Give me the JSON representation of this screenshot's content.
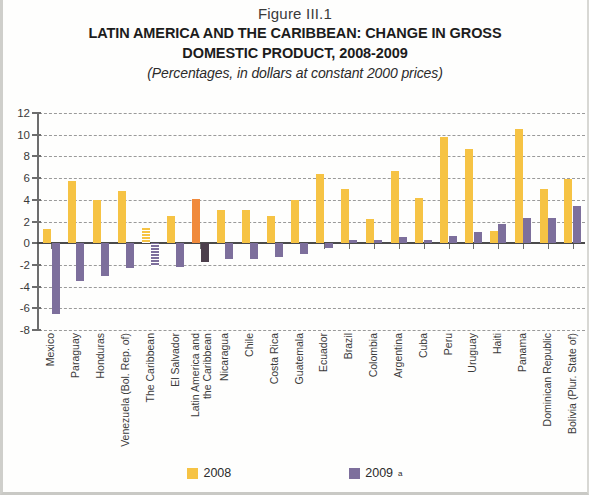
{
  "figure_number": "Figure III.1",
  "title_line1": "LATIN AMERICA AND THE CARIBBEAN: CHANGE IN GROSS",
  "title_line2": "DOMESTIC PRODUCT, 2008-2009",
  "subtitle": "(Percentages, in dollars at constant 2000 prices)",
  "legend": {
    "items": [
      {
        "label": "2008",
        "color": "#f6c344",
        "superscript": ""
      },
      {
        "label": "2009",
        "color": "#7d6f9c",
        "superscript": "a"
      }
    ]
  },
  "chart_data": {
    "type": "bar",
    "title": "LATIN AMERICA AND THE CARIBBEAN: CHANGE IN GROSS DOMESTIC PRODUCT, 2008-2009",
    "subtitle": "(Percentages, in dollars at constant 2000 prices)",
    "xlabel": "",
    "ylabel": "",
    "ylim": [
      -8,
      12
    ],
    "yticks": [
      12,
      10,
      8,
      6,
      4,
      2,
      0,
      -2,
      -4,
      -6,
      -8
    ],
    "ytick_labels": [
      "12",
      "10",
      "8",
      "6",
      "4",
      "2",
      "0",
      "-2",
      "-4",
      "-6",
      "-8"
    ],
    "grid": true,
    "legend_position": "bottom",
    "categories": [
      "Mexico",
      "Paraguay",
      "Honduras",
      "Venezuela (Bol. Rep. of)",
      "The Caribbean",
      "El Salvador",
      "Latin America and the Caribbean",
      "Nicaragua",
      "Chile",
      "Costa Rica",
      "Guatemala",
      "Ecuador",
      "Brazil",
      "Colombia",
      "Argentina",
      "Cuba",
      "Peru",
      "Uruguay",
      "Haiti",
      "Panama",
      "Dominican Republic",
      "Bolivia (Plur. State of)"
    ],
    "category_styles": [
      "normal",
      "normal",
      "normal",
      "normal",
      "hatch",
      "normal",
      "alt",
      "normal",
      "normal",
      "normal",
      "normal",
      "normal",
      "normal",
      "normal",
      "normal",
      "normal",
      "normal",
      "normal",
      "normal",
      "normal",
      "normal",
      "normal"
    ],
    "series": [
      {
        "name": "2008",
        "color": "#f6c344",
        "values": [
          1.3,
          5.7,
          4.0,
          4.8,
          1.4,
          2.5,
          4.1,
          3.1,
          3.1,
          2.5,
          4.0,
          6.4,
          5.0,
          2.2,
          6.7,
          4.2,
          9.8,
          8.7,
          1.1,
          10.5,
          5.0,
          5.9
        ]
      },
      {
        "name": "2009",
        "color": "#7d6f9c",
        "values": [
          -6.5,
          -3.5,
          -3.0,
          -2.3,
          -2.1,
          -2.2,
          -1.7,
          -1.5,
          -1.5,
          -1.3,
          -1.0,
          -0.4,
          0.3,
          0.3,
          0.6,
          0.3,
          0.7,
          1.0,
          1.8,
          2.3,
          2.3,
          3.4
        ]
      }
    ]
  }
}
